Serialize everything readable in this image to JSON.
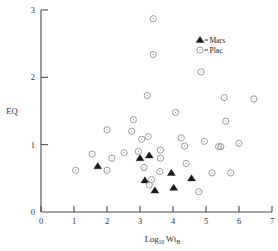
{
  "chart_data": {
    "type": "scatter",
    "title": "",
    "xlabel": "Log10 WtB",
    "xlabel_main": "Log",
    "xlabel_sub": "10",
    "xlabel_main2": "Wt",
    "xlabel_sub2": "B",
    "ylabel": "EQ",
    "xlim": [
      0,
      7
    ],
    "ylim": [
      0,
      3
    ],
    "xticks": [
      0,
      1,
      2,
      3,
      4,
      5,
      6,
      7
    ],
    "xticklabels": [
      "0",
      "1",
      "2",
      "3",
      "4",
      "5",
      "6",
      "7"
    ],
    "yticks": [
      0,
      1,
      2,
      3
    ],
    "yticklabels": [
      "0",
      "1",
      "2",
      "3"
    ],
    "grid": false,
    "legend_position": "upper-right",
    "series": [
      {
        "name": "Mars",
        "marker": "filled-triangle",
        "color": "#1a1a1a",
        "points": [
          {
            "x": 1.72,
            "y": 0.68
          },
          {
            "x": 3.0,
            "y": 0.8
          },
          {
            "x": 3.28,
            "y": 0.84
          },
          {
            "x": 3.15,
            "y": 0.47
          },
          {
            "x": 3.95,
            "y": 0.58
          },
          {
            "x": 4.02,
            "y": 0.36
          },
          {
            "x": 4.56,
            "y": 0.5
          },
          {
            "x": 3.45,
            "y": 0.32
          }
        ]
      },
      {
        "name": "Plac",
        "marker": "open-circle",
        "color": "#9a9a9a",
        "points": [
          {
            "x": 3.4,
            "y": 2.87
          },
          {
            "x": 3.4,
            "y": 2.34
          },
          {
            "x": 4.85,
            "y": 2.08
          },
          {
            "x": 3.22,
            "y": 1.73
          },
          {
            "x": 5.55,
            "y": 1.7
          },
          {
            "x": 2.0,
            "y": 1.22
          },
          {
            "x": 2.8,
            "y": 1.37
          },
          {
            "x": 2.75,
            "y": 1.2
          },
          {
            "x": 3.05,
            "y": 1.08
          },
          {
            "x": 3.25,
            "y": 1.12
          },
          {
            "x": 4.25,
            "y": 1.1
          },
          {
            "x": 4.35,
            "y": 0.98
          },
          {
            "x": 4.95,
            "y": 1.05
          },
          {
            "x": 1.55,
            "y": 0.86
          },
          {
            "x": 2.52,
            "y": 0.88
          },
          {
            "x": 2.95,
            "y": 0.9
          },
          {
            "x": 3.62,
            "y": 0.92
          },
          {
            "x": 3.62,
            "y": 0.8
          },
          {
            "x": 2.15,
            "y": 0.8
          },
          {
            "x": 3.12,
            "y": 0.66
          },
          {
            "x": 1.05,
            "y": 0.62
          },
          {
            "x": 2.0,
            "y": 0.62
          },
          {
            "x": 3.6,
            "y": 0.6
          },
          {
            "x": 3.35,
            "y": 0.48
          },
          {
            "x": 3.28,
            "y": 0.4
          },
          {
            "x": 5.38,
            "y": 0.97
          },
          {
            "x": 5.45,
            "y": 0.97
          },
          {
            "x": 6.0,
            "y": 1.02
          },
          {
            "x": 4.4,
            "y": 0.72
          },
          {
            "x": 5.18,
            "y": 0.58
          },
          {
            "x": 5.75,
            "y": 0.58
          },
          {
            "x": 4.78,
            "y": 0.3
          },
          {
            "x": 6.45,
            "y": 1.68
          },
          {
            "x": 4.08,
            "y": 1.48
          },
          {
            "x": 5.6,
            "y": 1.35
          }
        ]
      }
    ],
    "legend": [
      {
        "label": "Mars",
        "marker": "filled-triangle"
      },
      {
        "label": "Plac",
        "marker": "open-circle"
      }
    ]
  }
}
